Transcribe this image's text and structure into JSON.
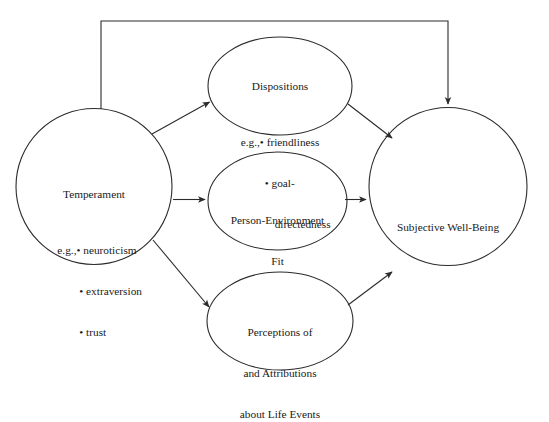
{
  "diagram": {
    "type": "conceptual-path-model",
    "background_color": "#ffffff",
    "stroke_color": "#2b2b2b",
    "nodes": [
      {
        "id": "temperament",
        "shape": "circle",
        "title": "Temperament",
        "eg_prefix": "e.g.,",
        "items": [
          "neuroticism",
          "extraversion",
          "trust"
        ],
        "lines": [
          "Temperament",
          "e.g., • neuroticism",
          "• extraversion",
          "• trust"
        ]
      },
      {
        "id": "dispositions",
        "shape": "ellipse",
        "title": "Dispositions",
        "eg_prefix": "e.g.,",
        "items": [
          "friendliness",
          "goal-directedness"
        ],
        "lines": [
          "Dispositions",
          "e.g., • friendliness",
          "• goal-",
          "directedness"
        ]
      },
      {
        "id": "person-environment-fit",
        "shape": "ellipse",
        "title": "Person-Environment Fit",
        "lines": [
          "Person-Environment",
          "Fit"
        ]
      },
      {
        "id": "perceptions-attributions",
        "shape": "ellipse",
        "title": "Perceptions of and Attributions about Life Events",
        "lines": [
          "Perceptions of",
          "and Attributions",
          "about Life Events"
        ]
      },
      {
        "id": "subjective-well-being",
        "shape": "circle",
        "title": "Subjective Well-Being",
        "lines": [
          "Subjective Well-Being"
        ]
      }
    ],
    "edges": [
      {
        "id": "temperament-to-dispositions",
        "from": "temperament",
        "to": "dispositions",
        "style": "straight-arrow"
      },
      {
        "id": "temperament-to-fit",
        "from": "temperament",
        "to": "person-environment-fit",
        "style": "straight-arrow"
      },
      {
        "id": "temperament-to-perceptions",
        "from": "temperament",
        "to": "perceptions-attributions",
        "style": "straight-arrow"
      },
      {
        "id": "dispositions-to-swb",
        "from": "dispositions",
        "to": "subjective-well-being",
        "style": "straight-arrow"
      },
      {
        "id": "fit-to-swb",
        "from": "person-environment-fit",
        "to": "subjective-well-being",
        "style": "straight-arrow"
      },
      {
        "id": "perceptions-to-swb",
        "from": "perceptions-attributions",
        "to": "subjective-well-being",
        "style": "straight-arrow"
      },
      {
        "id": "temperament-to-swb-direct",
        "from": "temperament",
        "to": "subjective-well-being",
        "style": "orthogonal-arrow-over-top"
      }
    ]
  },
  "labels": {
    "temperament": {
      "title": "Temperament",
      "eg": "e.g.,",
      "item1": "• neuroticism",
      "item2": "• extraversion",
      "item3": "• trust"
    },
    "dispositions": {
      "title": "Dispositions",
      "eg": "e.g.,",
      "item1": "• friendliness",
      "item2": "• goal-",
      "item2_cont": "directedness"
    },
    "fit": {
      "line1": "Person-Environment",
      "line2": "Fit"
    },
    "perceptions": {
      "line1": "Perceptions of",
      "line2": "and Attributions",
      "line3": "about Life Events"
    },
    "swb": {
      "line1": "Subjective Well-Being"
    }
  }
}
